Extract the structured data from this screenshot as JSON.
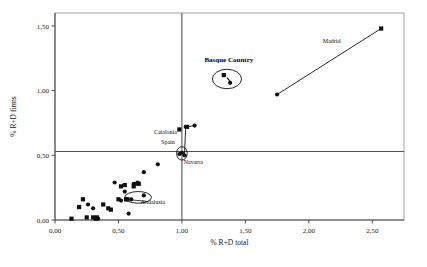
{
  "chart_data": {
    "type": "scatter",
    "title": "",
    "xlabel": "% R+D total",
    "ylabel": "% R+D firms",
    "xlim": [
      0.0,
      2.75
    ],
    "ylim": [
      0.0,
      1.6
    ],
    "xticks": [
      "0,00",
      "0,50",
      "1,00",
      "1,50",
      "2,00",
      "2,50"
    ],
    "xtickvals": [
      0.0,
      0.5,
      1.0,
      1.5,
      2.0,
      2.5
    ],
    "yticks": [
      "0,00",
      "0,50",
      "1,00",
      "1,50"
    ],
    "ytickvals": [
      0.0,
      0.5,
      1.0,
      1.5
    ],
    "grid": false,
    "legend": "none",
    "reference_lines": {
      "vertical_x": 1.0,
      "horizontal_y": 0.53
    },
    "series": [
      {
        "name": "squares",
        "marker": "square",
        "points": [
          [
            0.13,
            0.01
          ],
          [
            0.19,
            0.1
          ],
          [
            0.22,
            0.16
          ],
          [
            0.25,
            0.02
          ],
          [
            0.3,
            0.02
          ],
          [
            0.32,
            0.01
          ],
          [
            0.33,
            0.02
          ],
          [
            0.38,
            0.12
          ],
          [
            0.42,
            0.09
          ],
          [
            0.44,
            0.08
          ],
          [
            0.5,
            0.16
          ],
          [
            0.52,
            0.26
          ],
          [
            0.55,
            0.27
          ],
          [
            0.56,
            0.16
          ],
          [
            0.57,
            0.16
          ],
          [
            0.62,
            0.26
          ],
          [
            0.66,
            0.28
          ],
          [
            0.98,
            0.7
          ],
          [
            1.04,
            0.72
          ],
          [
            1.33,
            1.12
          ],
          [
            2.57,
            1.48
          ]
        ]
      },
      {
        "name": "circles",
        "marker": "circle",
        "points": [
          [
            0.26,
            0.12
          ],
          [
            0.3,
            0.09
          ],
          [
            0.34,
            0.01
          ],
          [
            0.47,
            0.29
          ],
          [
            0.52,
            0.15
          ],
          [
            0.55,
            0.22
          ],
          [
            0.58,
            0.05
          ],
          [
            0.6,
            0.16
          ],
          [
            0.62,
            0.28
          ],
          [
            0.64,
            0.28
          ],
          [
            0.65,
            0.29
          ],
          [
            0.7,
            0.19
          ],
          [
            0.7,
            0.37
          ],
          [
            0.81,
            0.43
          ],
          [
            0.98,
            0.51
          ],
          [
            1.0,
            0.52
          ],
          [
            1.02,
            0.5
          ],
          [
            1.03,
            0.72
          ],
          [
            1.1,
            0.73
          ],
          [
            1.38,
            1.06
          ],
          [
            1.75,
            0.97
          ]
        ]
      }
    ],
    "annotations": [
      {
        "label": "Madrid",
        "x": 2.18,
        "y": 1.37,
        "style": "plain"
      },
      {
        "label": "Basque Country",
        "x": 1.37,
        "y": 1.22,
        "style": "bold"
      },
      {
        "label": "Catalonia",
        "x": 0.87,
        "y": 0.665,
        "style": "plain"
      },
      {
        "label": "Spain",
        "x": 0.89,
        "y": 0.585,
        "style": "plain"
      },
      {
        "label": "Navarra",
        "x": 1.09,
        "y": 0.435,
        "style": "plain"
      },
      {
        "label": "Andalusia",
        "x": 0.77,
        "y": 0.125,
        "style": "plain"
      }
    ],
    "ellipses": [
      {
        "name": "basque-country-ellipse",
        "cx": 1.355,
        "cy": 1.09,
        "rx": 0.115,
        "ry": 0.075
      },
      {
        "name": "andalusia-ellipse",
        "cx": 0.655,
        "cy": 0.175,
        "rx": 0.105,
        "ry": 0.045
      },
      {
        "name": "spain-ellipse",
        "cx": 1.0,
        "cy": 0.515,
        "rx": 0.042,
        "ry": 0.052
      }
    ],
    "connectors": [
      {
        "name": "madrid-connector",
        "x1": 1.75,
        "y1": 0.97,
        "x2": 2.57,
        "y2": 1.48
      },
      {
        "name": "navarra-connector",
        "x1": 1.02,
        "y1": 0.5,
        "x2": 1.03,
        "y2": 0.72
      },
      {
        "name": "catalonia-connector",
        "x1": 1.04,
        "y1": 0.72,
        "x2": 1.1,
        "y2": 0.73
      }
    ],
    "colors": {
      "marker": "#101010",
      "axis": "#4d4d4d",
      "reference_line": "#555555",
      "frame": "#8a8a8a",
      "background": "#ffffff"
    }
  }
}
